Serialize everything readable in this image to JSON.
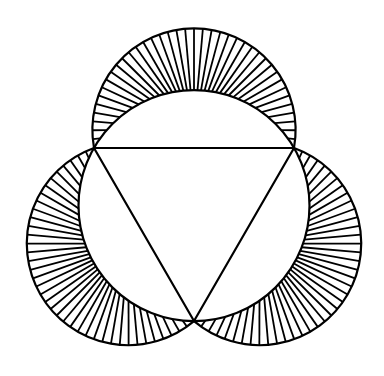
{
  "figure": {
    "colors": {
      "background": "#ffffff",
      "stroke": "#000000"
    },
    "triangle": {
      "vertices": [
        [
          94,
          148
        ],
        [
          294,
          148
        ],
        [
          194,
          321
        ]
      ]
    },
    "circumcircle": {
      "cx": 194,
      "cy": 205.7,
      "r": 115.5
    },
    "lunes": [
      {
        "name": "top",
        "cx": 194,
        "cy": 130,
        "r": 101.6,
        "hatch_count": 40
      },
      {
        "name": "left",
        "cx": 128.4,
        "cy": 243.6,
        "r": 101.6,
        "hatch_count": 40
      },
      {
        "name": "right",
        "cx": 259.6,
        "cy": 243.6,
        "r": 101.6,
        "hatch_count": 40
      }
    ],
    "stroke_width": 2.2,
    "hatch_width": 1.8
  }
}
